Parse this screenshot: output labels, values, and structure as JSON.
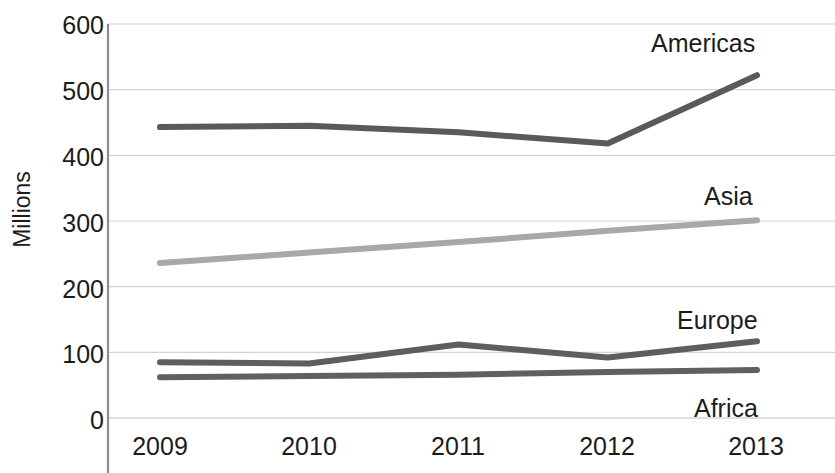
{
  "chart_data": {
    "type": "line",
    "title": "",
    "xlabel": "",
    "ylabel": "Millions",
    "categories": [
      "2009",
      "2010",
      "2011",
      "2012",
      "2013"
    ],
    "x": [
      2009,
      2010,
      2011,
      2012,
      2013
    ],
    "ylim": [
      0,
      600
    ],
    "yticks": [
      0,
      100,
      200,
      300,
      400,
      500,
      600
    ],
    "ytick_labels": [
      "0",
      "100",
      "200",
      "300",
      "400",
      "500",
      "600"
    ],
    "grid": "horizontal",
    "legend_position": "inline-right-of-series",
    "series": [
      {
        "name": "Americas",
        "values": [
          443,
          445,
          435,
          418,
          522
        ],
        "color": "#5a5a5a",
        "label_x": 2013,
        "label_y": 572
      },
      {
        "name": "Asia",
        "values": [
          236,
          252,
          268,
          285,
          301
        ],
        "color": "#a8a8a8",
        "label_x": 2013,
        "label_y": 343
      },
      {
        "name": "Europe",
        "values": [
          85,
          83,
          112,
          92,
          117
        ],
        "color": "#5e5e5e",
        "label_x": 2013,
        "label_y": 156
      },
      {
        "name": "Africa",
        "values": [
          62,
          64,
          66,
          70,
          73
        ],
        "color": "#606060",
        "label_x": 2013,
        "label_y": 22
      }
    ]
  },
  "axis": {
    "y_title": "Millions",
    "y_ticks": [
      "600",
      "500",
      "400",
      "300",
      "200",
      "100",
      "0"
    ],
    "x_ticks": [
      "2009",
      "2010",
      "2011",
      "2012",
      "2013"
    ]
  },
  "labels": {
    "americas": "Americas",
    "asia": "Asia",
    "europe": "Europe",
    "africa": "Africa"
  },
  "colors": {
    "americas": "#5a5a5a",
    "asia": "#a8a8a8",
    "europe": "#5e5e5e",
    "africa": "#606060",
    "gridline": "#d4d4d4",
    "axisline": "#8c8c8c",
    "text": "#1c1c1c",
    "background": "#ffffff"
  }
}
